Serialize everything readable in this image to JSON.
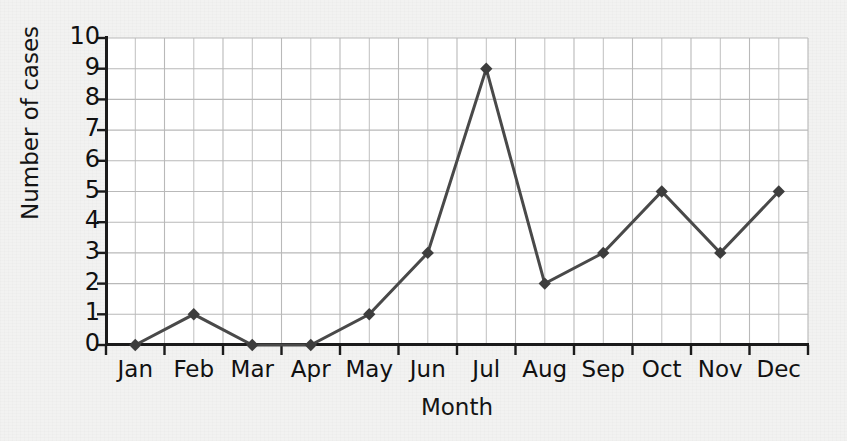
{
  "chart_data": {
    "type": "line",
    "title": "",
    "xlabel": "Month",
    "ylabel": "Number of cases",
    "categories": [
      "Jan",
      "Feb",
      "Mar",
      "Apr",
      "May",
      "Jun",
      "Jul",
      "Aug",
      "Sep",
      "Oct",
      "Nov",
      "Dec"
    ],
    "values": [
      0,
      1,
      0,
      0,
      1,
      3,
      9,
      2,
      3,
      5,
      3,
      5
    ],
    "series": [
      {
        "name": "Number of cases",
        "values": [
          0,
          1,
          0,
          0,
          1,
          3,
          9,
          2,
          3,
          5,
          3,
          5
        ]
      }
    ],
    "ylim": [
      0,
      10
    ],
    "ytick_labels": [
      "0",
      "1",
      "2",
      "3",
      "4",
      "5",
      "6",
      "7",
      "8",
      "9",
      "10"
    ],
    "ytick_values": [
      0,
      1,
      2,
      3,
      4,
      5,
      6,
      7,
      8,
      9,
      10
    ],
    "grid": true,
    "grid_minor_vertical": true,
    "legend": "none",
    "marker": "diamond",
    "line_color": "#494949",
    "marker_color": "#3d3d3d",
    "grid_color": "#b9b9b9",
    "axis_color": "#1b1b1b",
    "plot_background": "#ffffff",
    "page_background": "#f2f2f1"
  },
  "axes": {
    "y_axis_name": "Number of cases",
    "x_axis_name": "Month"
  }
}
